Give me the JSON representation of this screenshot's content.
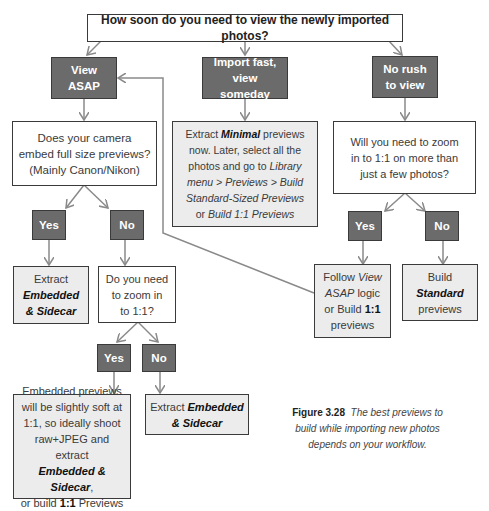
{
  "diagram": {
    "root_question": "How soon do you need to view the newly imported photos?",
    "branches": {
      "asap": {
        "label_line1": "View",
        "label_line2": "ASAP",
        "question": {
          "line1": "Does your camera",
          "line2": "embed full size previews?",
          "line3": "(Mainly Canon/Nikon)"
        },
        "yes_label": "Yes",
        "no_label": "No",
        "yes_result": {
          "line1": "Extract",
          "line2_bold": "Embedded",
          "line3_bold": "& Sidecar"
        },
        "no_question": {
          "line1": "Do you need",
          "line2": "to zoom in",
          "line3": "to 1:1?"
        },
        "zoom_yes_label": "Yes",
        "zoom_no_label": "No",
        "zoom_yes_result": {
          "line1": "Embedded previews",
          "line2": "will be slightly soft at",
          "line3": "1:1, so ideally shoot",
          "line4": "raw+JPEG and extract",
          "line5_bold": "Embedded & Sidecar",
          "line5_tail": ",",
          "line6_pre": "or build ",
          "line6_bold": "1:1",
          "line6_post": " Previews"
        },
        "zoom_no_result": {
          "pre": "Extract ",
          "bold1": "Embedded",
          "bold2": "& Sidecar"
        }
      },
      "fast": {
        "label_line1": "Import fast,",
        "label_line2": "view someday",
        "result": {
          "l1_pre": "Extract ",
          "l1_bold": "Minimal",
          "l1_post": " previews",
          "l2": "now. Later, select all the",
          "l3_pre": "photos and go to ",
          "l3_italic": "Library",
          "l4_italic": "menu > Previews > Build",
          "l5_italic": "Standard-Sized Previews",
          "l6_pre": "or ",
          "l6_italic": "Build 1:1 Previews"
        }
      },
      "norush": {
        "label_line1": "No rush",
        "label_line2": "to view",
        "question": {
          "line1": "Will you need to zoom",
          "line2": "in to 1:1 on more than",
          "line3": "just a few photos?"
        },
        "yes_label": "Yes",
        "no_label": "No",
        "yes_result": {
          "l1_pre": "Follow ",
          "l1_italic": "View",
          "l2_italic": "ASAP",
          "l2_post": " logic",
          "l3_pre": "or Build ",
          "l3_bold": "1:1",
          "l4": "previews"
        },
        "no_result": {
          "line1": "Build",
          "line2_bold": "Standard",
          "line3": "previews"
        }
      }
    },
    "caption": {
      "figure": "Figure 3.28",
      "text": "The best previews to build while importing new photos depends on your workflow."
    },
    "colors": {
      "dark_box": "#6b6b6b",
      "light_box": "#ececec",
      "border": "#3a3a3a",
      "arrow": "#8a8a8a"
    }
  }
}
